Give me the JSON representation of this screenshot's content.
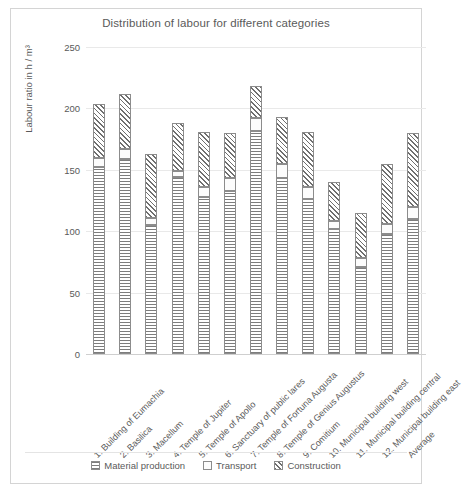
{
  "chart_data": {
    "type": "bar",
    "stacked": true,
    "title": "Distribution of labour for different categories",
    "xlabel": "",
    "ylabel": "Labour ratio in h / m³",
    "ylim": [
      0,
      250
    ],
    "yticks": [
      0,
      50,
      100,
      150,
      200,
      250
    ],
    "grid": true,
    "legend_position": "bottom",
    "categories": [
      "1. Building of Eumachia",
      "2. Basilica",
      "3. Macellum",
      "4. Temple of Jupiter",
      "5. Temple of Apollo",
      "6. Sanctuary of public lares",
      "7. Temple of Fortuna Augusta",
      "8. Temple of Genius Augustus",
      "9. Comitium",
      "10. Municipal building west",
      "11. Municipal building central",
      "12. Municipal building east",
      "Average"
    ],
    "series": [
      {
        "name": "Material production",
        "values": [
          152,
          159,
          105,
          144,
          128,
          133,
          182,
          143,
          126,
          102,
          71,
          98,
          110
        ]
      },
      {
        "name": "Transport",
        "values": [
          8,
          8,
          6,
          5,
          8,
          10,
          10,
          12,
          10,
          6,
          7,
          8,
          10
        ]
      },
      {
        "name": "Construction",
        "values": [
          44,
          45,
          52,
          39,
          45,
          37,
          26,
          38,
          45,
          32,
          37,
          49,
          60
        ]
      }
    ],
    "totals": [
      204,
      212,
      163,
      188,
      181,
      180,
      218,
      193,
      181,
      140,
      115,
      155,
      180
    ]
  },
  "legend": {
    "items": [
      {
        "label": "Material production",
        "pattern": "horizontal-lines"
      },
      {
        "label": "Transport",
        "pattern": "blank"
      },
      {
        "label": "Construction",
        "pattern": "diagonal-crosshatch"
      }
    ]
  }
}
